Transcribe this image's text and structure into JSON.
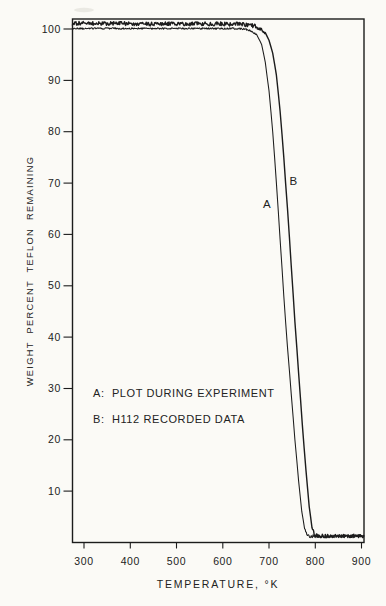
{
  "page": {
    "background": "#fbfaf6",
    "ink": "#1c1c1c"
  },
  "chart_data": {
    "type": "line",
    "title": "",
    "xlabel": "TEMPERATURE, °K",
    "ylabel": "WEIGHT PERCENT TEFLON REMAINING",
    "xlim": [
      275,
      905
    ],
    "ylim": [
      0,
      102
    ],
    "x_ticks": [
      300,
      400,
      500,
      600,
      700,
      800,
      900
    ],
    "y_ticks": [
      10,
      20,
      30,
      40,
      50,
      60,
      70,
      80,
      90,
      100
    ],
    "grid": false,
    "frame": true,
    "legend_position": "inside lower-left area",
    "legend": [
      {
        "key": "A",
        "label": "A:  PLOT DURING EXPERIMENT"
      },
      {
        "key": "B",
        "label": "B:  H112 RECORDED DATA"
      }
    ],
    "curve_labels": [
      {
        "text": "A",
        "x": 696,
        "y": 66
      },
      {
        "text": "B",
        "x": 753,
        "y": 70.5
      }
    ],
    "series": [
      {
        "name": "A",
        "description": "plot during experiment (noisy plateau ~100%, sharp drop ~690-785 K, residue ~1%)",
        "points": [
          [
            275,
            100.1
          ],
          [
            350,
            100.1
          ],
          [
            450,
            100.1
          ],
          [
            550,
            100.1
          ],
          [
            620,
            100.1
          ],
          [
            648,
            100.0
          ],
          [
            662,
            99.6
          ],
          [
            674,
            98.8
          ],
          [
            684,
            97.0
          ],
          [
            692,
            93.5
          ],
          [
            700,
            88.0
          ],
          [
            708,
            80.0
          ],
          [
            716,
            70.0
          ],
          [
            724,
            59.0
          ],
          [
            732,
            48.0
          ],
          [
            740,
            38.0
          ],
          [
            748,
            29.0
          ],
          [
            756,
            20.0
          ],
          [
            764,
            12.0
          ],
          [
            771,
            6.0
          ],
          [
            777,
            2.8
          ],
          [
            783,
            1.5
          ],
          [
            790,
            1.2
          ],
          [
            850,
            1.2
          ],
          [
            905,
            1.2
          ]
        ]
      },
      {
        "name": "B",
        "description": "H112 recorded data (noisy plateau ~101%, sharp drop ~700-798 K, residue ~1.3%)",
        "points": [
          [
            275,
            101.1
          ],
          [
            350,
            101.1
          ],
          [
            450,
            101.0
          ],
          [
            550,
            101.0
          ],
          [
            620,
            101.0
          ],
          [
            660,
            100.8
          ],
          [
            680,
            100.2
          ],
          [
            692,
            99.3
          ],
          [
            700,
            97.8
          ],
          [
            708,
            95.3
          ],
          [
            716,
            91.0
          ],
          [
            724,
            84.0
          ],
          [
            732,
            75.0
          ],
          [
            740,
            65.0
          ],
          [
            748,
            54.0
          ],
          [
            756,
            43.0
          ],
          [
            764,
            33.0
          ],
          [
            772,
            23.0
          ],
          [
            780,
            14.0
          ],
          [
            787,
            7.0
          ],
          [
            793,
            3.0
          ],
          [
            798,
            1.6
          ],
          [
            805,
            1.3
          ],
          [
            850,
            1.3
          ],
          [
            905,
            1.3
          ]
        ]
      }
    ]
  }
}
